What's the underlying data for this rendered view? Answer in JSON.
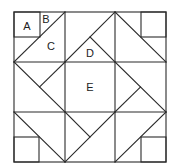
{
  "diagram": {
    "type": "quilt-block",
    "labels": [
      {
        "id": "A",
        "text": "A",
        "x": 27,
        "y": 26
      },
      {
        "id": "B",
        "text": "B",
        "x": 46,
        "y": 19
      },
      {
        "id": "C",
        "text": "C",
        "x": 51,
        "y": 46
      },
      {
        "id": "D",
        "text": "D",
        "x": 90,
        "y": 53
      },
      {
        "id": "E",
        "text": "E",
        "x": 90,
        "y": 87
      }
    ],
    "colors": {
      "line": "#2a2a2a",
      "background": "#ffffff"
    }
  }
}
